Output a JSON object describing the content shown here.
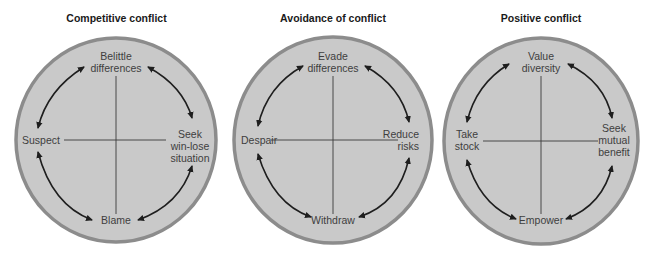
{
  "colors": {
    "circle_fill": "#c9c9c9",
    "circle_border": "#8c8c8c",
    "axis_line": "#3a3a3a",
    "arrow": "#1e1e1e",
    "label_text": "#3e3e3e",
    "title_text": "#1a1a1a"
  },
  "diagrams": [
    {
      "title": "Competitive conflict",
      "top": [
        "Belittle",
        "differences"
      ],
      "right": [
        "Seek",
        "win-lose",
        "situation"
      ],
      "bottom": [
        "Blame"
      ],
      "left": [
        "Suspect"
      ]
    },
    {
      "title": "Avoidance of conflict",
      "top": [
        "Evade",
        "differences"
      ],
      "right": [
        "Reduce",
        "risks"
      ],
      "bottom": [
        "Withdraw"
      ],
      "left": [
        "Despair"
      ]
    },
    {
      "title": "Positive conflict",
      "top": [
        "Value",
        "diversity"
      ],
      "right": [
        "Seek",
        "mutual",
        "benefit"
      ],
      "bottom": [
        "Empower"
      ],
      "left": [
        "Take",
        "stock"
      ]
    }
  ]
}
